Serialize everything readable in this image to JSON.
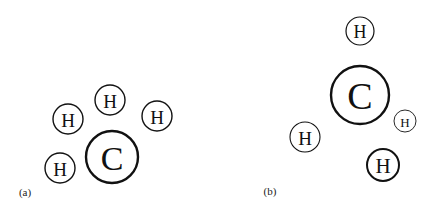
{
  "figure": {
    "panels": [
      {
        "id": "a",
        "label": "(a)",
        "label_pos": [
          25,
          192
        ],
        "atoms": [
          {
            "symbol": "H",
            "cx": 68,
            "cy": 119,
            "r": 15,
            "stroke": 1.4,
            "font": 19
          },
          {
            "symbol": "H",
            "cx": 110,
            "cy": 100,
            "r": 15,
            "stroke": 1.4,
            "font": 19
          },
          {
            "symbol": "H",
            "cx": 157,
            "cy": 116,
            "r": 15,
            "stroke": 1.4,
            "font": 19
          },
          {
            "symbol": "H",
            "cx": 60,
            "cy": 168,
            "r": 15,
            "stroke": 1.4,
            "font": 19
          },
          {
            "symbol": "C",
            "cx": 112,
            "cy": 157,
            "r": 26,
            "stroke": 2.4,
            "font": 34
          }
        ]
      },
      {
        "id": "b",
        "label": "(b)",
        "label_pos": [
          270,
          191
        ],
        "atoms": [
          {
            "symbol": "H",
            "cx": 360,
            "cy": 31,
            "r": 14,
            "stroke": 1.2,
            "font": 18
          },
          {
            "symbol": "C",
            "cx": 360,
            "cy": 95,
            "r": 29,
            "stroke": 2.4,
            "font": 38
          },
          {
            "symbol": "H",
            "cx": 405,
            "cy": 121,
            "r": 11,
            "stroke": 0.9,
            "font": 13
          },
          {
            "symbol": "H",
            "cx": 305,
            "cy": 137,
            "r": 15,
            "stroke": 1.1,
            "font": 19
          },
          {
            "symbol": "H",
            "cx": 383,
            "cy": 165,
            "r": 16,
            "stroke": 2.0,
            "font": 21
          }
        ]
      }
    ]
  }
}
